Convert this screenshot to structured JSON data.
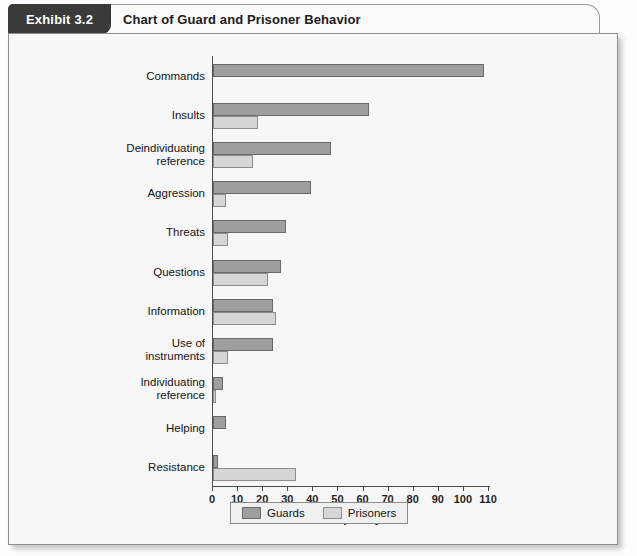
{
  "exhibit": {
    "badge": "Exhibit 3.2",
    "title": "Chart of Guard and Prisoner Behavior"
  },
  "legend": {
    "guards_label": "Guards",
    "prisoners_label": "Prisoners",
    "guards_color": "#9e9e9e",
    "prisoners_color": "#d6d6d6"
  },
  "chart_data": {
    "type": "bar",
    "orientation": "horizontal",
    "title": "Chart of Guard and Prisoner Behavior",
    "xlabel": "Frequency",
    "ylabel": "",
    "xlim": [
      0,
      110
    ],
    "xticks": [
      0,
      10,
      20,
      30,
      40,
      50,
      60,
      70,
      80,
      90,
      100,
      110
    ],
    "grid": false,
    "legend_position": "bottom",
    "categories": [
      "Commands",
      "Insults",
      "Deindividuating\nreference",
      "Aggression",
      "Threats",
      "Questions",
      "Information",
      "Use of\ninstruments",
      "Individuating\nreference",
      "Helping",
      "Resistance"
    ],
    "series": [
      {
        "name": "Guards",
        "color": "#9e9e9e",
        "values": [
          108,
          62,
          47,
          39,
          29,
          27,
          24,
          24,
          4,
          5,
          2
        ]
      },
      {
        "name": "Prisoners",
        "color": "#d6d6d6",
        "values": [
          0,
          18,
          16,
          5,
          6,
          22,
          25,
          6,
          1,
          0,
          33
        ]
      }
    ]
  }
}
